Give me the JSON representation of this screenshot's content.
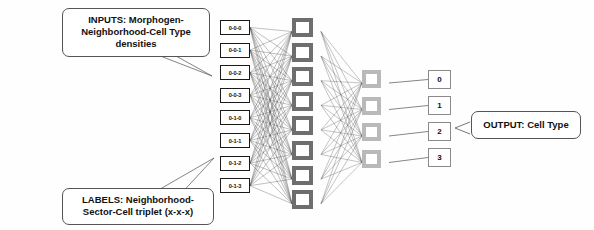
{
  "diagram": {
    "callouts": {
      "inputs": {
        "line1": "INPUTS: Morphogen-",
        "line2": "Neighborhood-Cell Type densities"
      },
      "labels": {
        "line1": "LABELS: Neighborhood-",
        "line2": "Sector-Cell triplet (x-x-x)"
      },
      "output": {
        "line1": "OUTPUT: Cell Type"
      }
    },
    "layers": {
      "input": {
        "name": "input-layer",
        "count": 8,
        "nodes": [
          {
            "label": "0-0-0"
          },
          {
            "label": "0-0-1"
          },
          {
            "label": "0-0-2"
          },
          {
            "label": "0-0-3"
          },
          {
            "label": "0-1-0"
          },
          {
            "label": "0-1-1"
          },
          {
            "label": "0-1-2"
          },
          {
            "label": "0-1-3"
          }
        ]
      },
      "hidden1": {
        "name": "hidden-layer-1",
        "count": 8,
        "nodes": [
          "",
          "",
          "",
          "",
          "",
          "",
          "",
          ""
        ]
      },
      "hidden2": {
        "name": "hidden-layer-2",
        "count": 4,
        "nodes": [
          "",
          "",
          "",
          ""
        ]
      },
      "output": {
        "name": "output-layer",
        "count": 4,
        "nodes": [
          {
            "label": "0"
          },
          {
            "label": "1"
          },
          {
            "label": "2"
          },
          {
            "label": "3"
          }
        ]
      }
    },
    "colors": {
      "input_border": "#1a1a1a",
      "hidden1_border": "#6e6e6e",
      "hidden2_border": "#b9b9b9",
      "output_border": "#8a8a8a",
      "edge": "#4a4a4a",
      "callout_border": "#555555",
      "background": "#ffffff"
    }
  }
}
